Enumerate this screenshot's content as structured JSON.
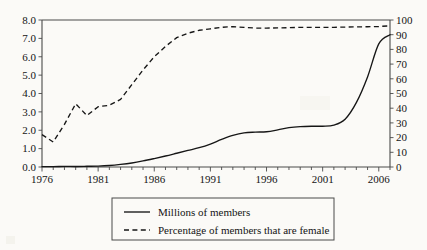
{
  "chart_data": {
    "type": "line",
    "title": "",
    "xlabel": "",
    "ylabel": "",
    "grid": false,
    "legend_position": "bottom",
    "x": [
      1976,
      1977,
      1978,
      1979,
      1980,
      1981,
      1982,
      1983,
      1984,
      1985,
      1986,
      1987,
      1988,
      1989,
      1990,
      1991,
      1992,
      1993,
      1994,
      1995,
      1996,
      1997,
      1998,
      1999,
      2000,
      2001,
      2002,
      2003,
      2004,
      2005,
      2006,
      2007
    ],
    "xlim": [
      1976,
      2007
    ],
    "xticks_major": [
      1976,
      1981,
      1986,
      1991,
      1996,
      2001,
      2006
    ],
    "xtick_labels": [
      "1976",
      "1981",
      "1986",
      "1991",
      "1996",
      "2001",
      "2006"
    ],
    "xtick_interval_minor": 1,
    "left_axis": {
      "label": "Millions of members",
      "ylim": [
        0.0,
        8.0
      ],
      "step": 1.0,
      "tick_labels": [
        "0.0",
        "1.0",
        "2.0",
        "3.0",
        "4.0",
        "5.0",
        "6.0",
        "7.0",
        "8.0"
      ]
    },
    "right_axis": {
      "label": "Percentage of members that are female",
      "ylim": [
        0,
        100
      ],
      "step": 10,
      "tick_labels": [
        "0",
        "10",
        "20",
        "30",
        "40",
        "50",
        "60",
        "70",
        "80",
        "90",
        "100"
      ]
    },
    "series": [
      {
        "name": "Millions of members",
        "axis": "left",
        "style": "solid",
        "color": "#161616",
        "values": [
          0.02,
          0.02,
          0.03,
          0.03,
          0.04,
          0.05,
          0.08,
          0.14,
          0.22,
          0.33,
          0.46,
          0.6,
          0.75,
          0.9,
          1.05,
          1.25,
          1.5,
          1.72,
          1.86,
          1.9,
          1.92,
          2.02,
          2.14,
          2.2,
          2.22,
          2.22,
          2.28,
          2.6,
          3.5,
          4.9,
          6.7,
          7.2
        ]
      },
      {
        "name": "Percentage of members that are female",
        "axis": "right",
        "style": "dashed",
        "color": "#161616",
        "values": [
          22,
          17,
          29,
          43,
          35,
          41,
          42,
          46,
          56,
          66,
          75,
          82,
          88,
          91,
          93,
          94,
          95,
          95.5,
          95,
          94.5,
          94.5,
          94.6,
          94.8,
          95,
          95,
          95,
          95,
          95.2,
          95.3,
          95.4,
          95.6,
          96
        ]
      }
    ]
  },
  "legend": {
    "items": [
      {
        "label": "Millions of members",
        "style": "solid"
      },
      {
        "label": "Percentage of members that are female",
        "style": "dashed"
      }
    ]
  }
}
